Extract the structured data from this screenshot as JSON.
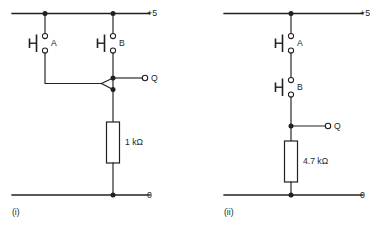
{
  "figure": {
    "background_color": "#ffffff",
    "line_color": "#231f20"
  },
  "circuits": [
    {
      "id": "circuit-i",
      "caption": "(i)",
      "supply_label": "+5",
      "ground_label": "0",
      "output_label": "Q",
      "topology": "parallel",
      "switches": [
        {
          "label": "A",
          "type": "push-button-normally-open"
        },
        {
          "label": "B",
          "type": "push-button-normally-open"
        }
      ],
      "resistor": {
        "value": "1 kΩ",
        "role": "pull-down"
      }
    },
    {
      "id": "circuit-ii",
      "caption": "(ii)",
      "supply_label": "+5",
      "ground_label": "0",
      "output_label": "Q",
      "topology": "series",
      "switches": [
        {
          "label": "A",
          "type": "push-button-normally-open"
        },
        {
          "label": "B",
          "type": "push-button-normally-open"
        }
      ],
      "resistor": {
        "value": "4.7 kΩ",
        "role": "pull-down"
      }
    }
  ]
}
